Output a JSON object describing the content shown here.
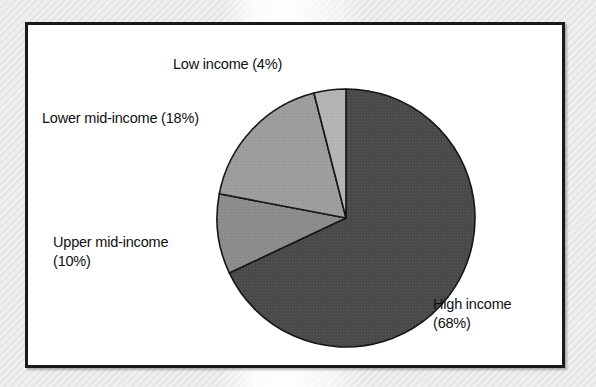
{
  "chart_data": {
    "type": "pie",
    "title": "",
    "subtitle": "",
    "xlabel": "",
    "ylabel": "",
    "legend_position": "none",
    "grid": false,
    "unit": "%",
    "categories": [
      "High income",
      "Upper mid-income",
      "Lower mid-income",
      "Low income"
    ],
    "values": [
      68,
      10,
      18,
      4
    ],
    "slices": [
      {
        "name": "high-income",
        "label": "High income",
        "percent": 68,
        "percent_text": "(68%)",
        "color": "#4a4a4a",
        "start_angle_deg": 0,
        "end_angle_deg": 244.8,
        "label_lines": [
          "High income",
          "(68%)"
        ],
        "label_position": "right"
      },
      {
        "name": "upper-mid-income",
        "label": "Upper mid-income",
        "percent": 10,
        "percent_text": "(10%)",
        "color": "#8c8c8c",
        "start_angle_deg": 244.8,
        "end_angle_deg": 280.8,
        "label_lines": [
          "Upper mid-income",
          "(10%)"
        ],
        "label_position": "left"
      },
      {
        "name": "lower-mid-income",
        "label": "Lower mid-income",
        "percent": 18,
        "percent_text": "(18%)",
        "color": "#9d9d9d",
        "start_angle_deg": 280.8,
        "end_angle_deg": 345.6,
        "label_lines": [
          "Lower mid-income (18%)"
        ],
        "label_position": "upper-left"
      },
      {
        "name": "low-income",
        "label": "Low income",
        "percent": 4,
        "percent_text": "(4%)",
        "color": "#b4b4b4",
        "start_angle_deg": 345.6,
        "end_angle_deg": 360,
        "label_lines": [
          "Low income (4%)"
        ],
        "label_position": "top"
      }
    ]
  },
  "labels": {
    "low_income": "Low income (4%)",
    "lower_mid_income": "Lower mid-income (18%)",
    "upper_mid_income_line1": "Upper mid-income",
    "upper_mid_income_line2": "(10%)",
    "high_income_line1": "High income",
    "high_income_line2": "(68%)"
  },
  "colors": {
    "high_income": "#4a4a4a",
    "upper_mid_income": "#8c8c8c",
    "lower_mid_income": "#9d9d9d",
    "low_income": "#b4b4b4",
    "slice_outline": "#151515",
    "frame_border": "#1a1a1a",
    "plot_background": "#ffffff",
    "text": "#101010"
  }
}
